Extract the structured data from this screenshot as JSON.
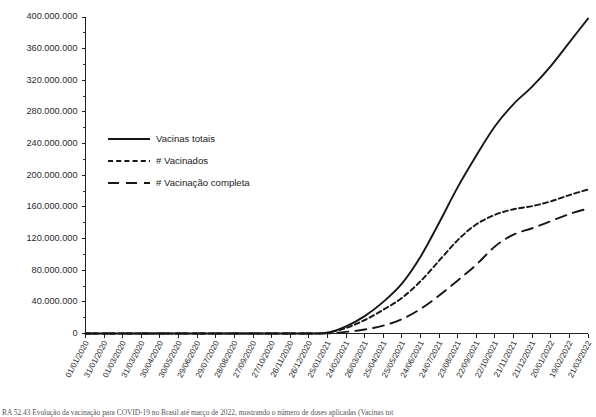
{
  "chart_data": {
    "type": "line",
    "title": "",
    "xlabel": "",
    "ylabel": "",
    "ylim": [
      0,
      400000000
    ],
    "ytick_step": 40000000,
    "yminor_step": 20000000,
    "grid": false,
    "legend_position": "left-center",
    "ytick_labels": [
      "0",
      "40.000.000",
      "80.000.000",
      "120.000.000",
      "160.000.000",
      "200.000.000",
      "240.000.000",
      "280.000.000",
      "320.000.000",
      "360.000.000",
      "400.000.000"
    ],
    "ytick_values": [
      0,
      40000000,
      80000000,
      120000000,
      160000000,
      200000000,
      240000000,
      280000000,
      320000000,
      360000000,
      400000000
    ],
    "categories": [
      "01/01/2020",
      "31/01/2020",
      "01/03/2020",
      "31/03/2020",
      "30/04/2020",
      "30/05/2020",
      "29/06/2020",
      "29/07/2020",
      "28/08/2020",
      "27/09/2020",
      "27/10/2020",
      "26/11/2020",
      "26/12/2020",
      "25/01/2021",
      "24/02/2021",
      "26/03/2021",
      "25/04/2021",
      "25/05/2021",
      "24/06/2021",
      "24/07/2021",
      "23/08/2021",
      "22/09/2021",
      "22/10/2021",
      "21/11/2021",
      "21/12/2021",
      "20/01/2022",
      "19/02/2022",
      "21/03/2022"
    ],
    "series": [
      {
        "name": "Vacinas totais",
        "style": "solid",
        "values": [
          0,
          0,
          0,
          0,
          0,
          0,
          0,
          0,
          0,
          0,
          0,
          0,
          0,
          1000000,
          9000000,
          22000000,
          40000000,
          63000000,
          97000000,
          140000000,
          185000000,
          225000000,
          262000000,
          290000000,
          312000000,
          338000000,
          368000000,
          398000000
        ]
      },
      {
        "name": "# Vacinados",
        "style": "dashed",
        "values": [
          0,
          0,
          0,
          0,
          0,
          0,
          0,
          0,
          0,
          0,
          0,
          0,
          0,
          900000,
          7000000,
          17000000,
          30000000,
          45000000,
          66000000,
          92000000,
          118000000,
          138000000,
          150000000,
          157000000,
          161000000,
          167000000,
          175000000,
          182000000
        ]
      },
      {
        "name": "# Vacinação completa",
        "style": "long-dash",
        "values": [
          0,
          0,
          0,
          0,
          0,
          0,
          0,
          0,
          0,
          0,
          0,
          0,
          0,
          100000,
          2000000,
          5000000,
          10000000,
          18000000,
          31000000,
          48000000,
          67000000,
          87000000,
          110000000,
          125000000,
          133000000,
          142000000,
          151000000,
          158000000
        ]
      }
    ],
    "legend_entries": [
      {
        "label": "Vacinas totais",
        "style": "solid"
      },
      {
        "label": "# Vacinados",
        "style": "dashed"
      },
      {
        "label": "# Vacinação completa",
        "style": "long-dash"
      }
    ],
    "line_color": "#161616"
  },
  "caption": {
    "text": "RA 52.43 Evolução da vacinação para COVID-19 no Brasil até março de 2022, mostrando o número de doses aplicadas (Vacinas tot"
  }
}
